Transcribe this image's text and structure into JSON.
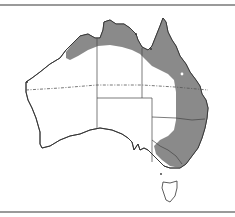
{
  "figure": {
    "type": "distribution-map",
    "region": "Australia",
    "colors": {
      "background": "#ffffff",
      "land": "#ffffff",
      "range_fill": "#8a8a8a",
      "coastline": "#333333",
      "borders": "#444444",
      "tropic_line": "#555555",
      "frame_line": "#9a9a9a"
    },
    "features": {
      "shaded_range": "north and east coastal distribution",
      "tropic_of_capricorn": "dashed line",
      "state_borders": true,
      "tasmania": true,
      "point_marker": "white dot in Queensland"
    }
  }
}
